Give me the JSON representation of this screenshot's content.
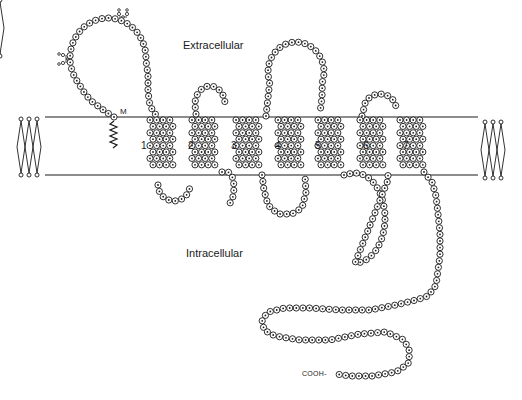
{
  "diagram": {
    "type": "GPCR seven-transmembrane snake plot",
    "labels": {
      "extracellular": "Extracellular",
      "intracellular": "Intracellular",
      "c_terminus": "COOH-",
      "lipid_anchor": "M"
    },
    "helices": [
      {
        "number": "1",
        "x": 143,
        "y": 146
      },
      {
        "number": "2",
        "x": 189,
        "y": 146
      },
      {
        "number": "3",
        "x": 232,
        "y": 146
      },
      {
        "number": "4",
        "x": 276,
        "y": 146
      },
      {
        "number": "5",
        "x": 316,
        "y": 146
      },
      {
        "number": "6",
        "x": 364,
        "y": 146
      },
      {
        "number": "7",
        "x": 404,
        "y": 146
      }
    ],
    "membrane": {
      "top_y": 117,
      "bottom_y": 175,
      "x_start": 45,
      "x_end": 478
    },
    "colors": {
      "ink": "#1a1a1a",
      "background": "#ffffff"
    }
  }
}
